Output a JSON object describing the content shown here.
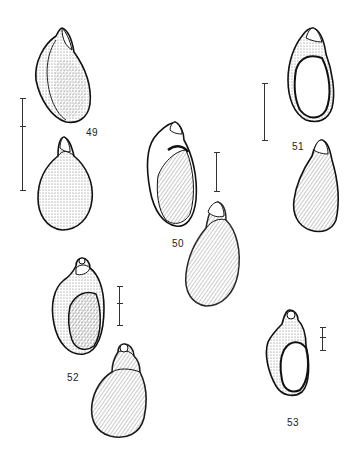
{
  "plate": {
    "figures": [
      {
        "number": "49",
        "views": [
          "apertural view",
          "abapertural view"
        ]
      },
      {
        "number": "50",
        "views": [
          "apertural view",
          "abapertural view"
        ]
      },
      {
        "number": "51",
        "views": [
          "apertural view",
          "abapertural view"
        ]
      },
      {
        "number": "52",
        "views": [
          "apertural view",
          "abapertural view"
        ]
      },
      {
        "number": "53",
        "views": [
          "apertural view"
        ]
      }
    ],
    "labels": {
      "fig49": "49",
      "fig50": "50",
      "fig51": "51",
      "fig52": "52",
      "fig53": "53"
    }
  }
}
